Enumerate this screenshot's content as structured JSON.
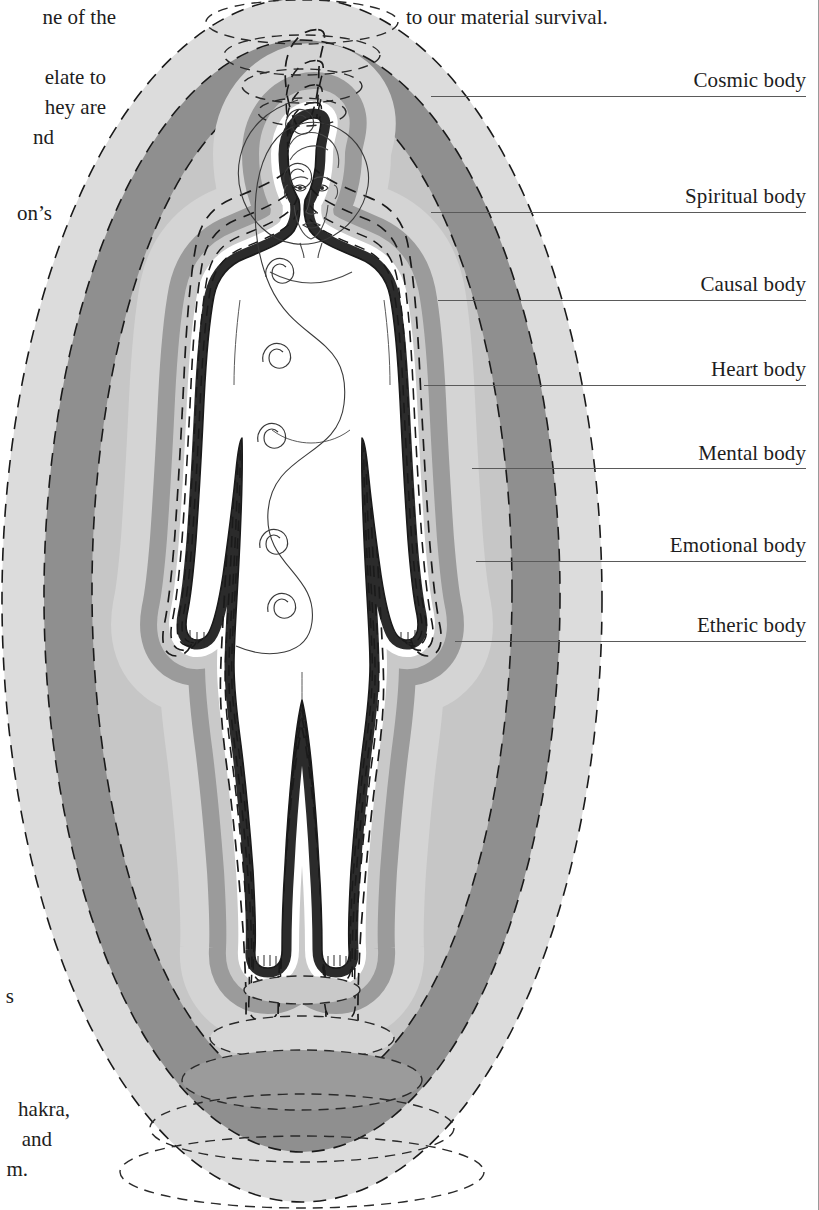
{
  "page": {
    "width": 819,
    "height": 1210,
    "background": "#ffffff",
    "margin_rule_color": "#9a9a9a"
  },
  "surrounding_text": {
    "top_fragment": "to our material survival.",
    "left_fragments": [
      "ne of the",
      "elate to",
      "hey are",
      "nd",
      "on’s",
      "s",
      "hakra,",
      "and",
      "m."
    ]
  },
  "diagram": {
    "type": "anatomical-aura-diagram",
    "figure": "standing human figure, front view, arms at sides",
    "leader_line_color": "#5a5a5a",
    "labels": [
      {
        "id": "cosmic",
        "text": "Cosmic body",
        "text_y": 84,
        "leader_y": 96,
        "leader_x_start": 431
      },
      {
        "id": "spiritual",
        "text": "Spiritual body",
        "text_y": 200,
        "leader_y": 212,
        "leader_x_start": 431
      },
      {
        "id": "causal",
        "text": "Causal body",
        "text_y": 288,
        "leader_y": 300,
        "leader_x_start": 438
      },
      {
        "id": "heart",
        "text": "Heart body",
        "text_y": 373,
        "leader_y": 385,
        "leader_x_start": 424
      },
      {
        "id": "mental",
        "text": "Mental body",
        "text_y": 457,
        "leader_y": 468,
        "leader_x_start": 472
      },
      {
        "id": "emotional",
        "text": "Emotional body",
        "text_y": 549,
        "leader_y": 561,
        "leader_x_start": 476
      },
      {
        "id": "etheric",
        "text": "Etheric body",
        "text_y": 629,
        "leader_y": 641,
        "leader_x_start": 455
      }
    ],
    "layers": [
      {
        "name": "Cosmic body",
        "fill": "#d9d9d9",
        "order": 7
      },
      {
        "name": "Spiritual body",
        "fill": "#8f8f8f",
        "order": 6
      },
      {
        "name": "Causal body",
        "fill": "#bdbdbd",
        "order": 5
      },
      {
        "name": "Heart body",
        "fill": "#d4d4d4",
        "order": 4
      },
      {
        "name": "Mental body",
        "fill": "#9b9b9b",
        "order": 3
      },
      {
        "name": "Emotional body",
        "fill": "#ffffff",
        "order": 2
      },
      {
        "name": "Etheric body",
        "fill": "#2b2b2b",
        "order": 1
      }
    ],
    "chakras": {
      "count": 7,
      "glyph": "spiral",
      "positions_note": "crown, brow, throat, heart, solar plexus, sacral, root"
    },
    "dashed_outline_color": "#1a1a1a"
  }
}
